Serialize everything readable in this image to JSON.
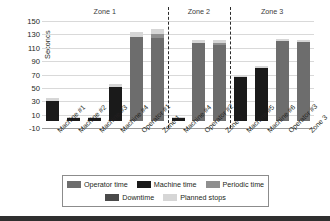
{
  "chart_data": {
    "type": "bar",
    "title": "",
    "xlabel": "",
    "ylabel": "Seconds",
    "ylim": [
      -10,
      150
    ],
    "yticks": [
      -10,
      10,
      30,
      50,
      70,
      90,
      110,
      130,
      150
    ],
    "grid": true,
    "stacked": true,
    "legend_position": "bottom",
    "legend": [
      "Operator time",
      "Machine time",
      "Periodic time",
      "Downtime",
      "Planned stops"
    ],
    "group_labels": [
      "Zone 1",
      "Zone 2",
      "Zone 3"
    ],
    "groups": [
      {
        "name": "Zone 1",
        "categories": [
          "Machine #1",
          "Machine #2",
          "Machine #3",
          "Machine #4",
          "Operator #1",
          "Zone 1"
        ]
      },
      {
        "name": "Zone 2",
        "categories": [
          "Machine #4",
          "Operator #2",
          "Zone 2"
        ]
      },
      {
        "name": "Zone 3",
        "categories": [
          "Machine #5",
          "Machine #6",
          "Operator #3",
          "Zone 3"
        ]
      }
    ],
    "categories": [
      "Machine #1",
      "Machine #2",
      "Machine #3",
      "Machine #4",
      "Operator #1",
      "Zone 1",
      "Machine #4",
      "Operator #2",
      "Zone 2",
      "Machine #5",
      "Machine #6",
      "Operator #3",
      "Zone 3"
    ],
    "series": [
      {
        "name": "Operator time",
        "color": "#6d6d6d",
        "values": [
          0,
          0,
          0,
          0,
          126,
          125,
          0,
          117,
          114,
          0,
          0,
          120,
          119
        ]
      },
      {
        "name": "Machine time",
        "color": "#1a1a1a",
        "values": [
          30,
          5,
          5,
          52,
          0,
          0,
          5,
          0,
          0,
          66,
          79,
          0,
          0
        ]
      },
      {
        "name": "Periodic time",
        "color": "#8f8f8f",
        "values": [
          0,
          0,
          0,
          0,
          0,
          5,
          0,
          0,
          3,
          0,
          0,
          0,
          0
        ]
      },
      {
        "name": "Downtime",
        "color": "#4a4a4a",
        "values": [
          0,
          0,
          0,
          0,
          0,
          0,
          0,
          0,
          0,
          0,
          0,
          0,
          0
        ]
      },
      {
        "name": "Planned stops",
        "color": "#d6d6d6",
        "values": [
          5,
          2,
          2,
          4,
          7,
          8,
          2,
          4,
          5,
          3,
          3,
          3,
          3
        ]
      }
    ],
    "totals": [
      35,
      7,
      7,
      56,
      133,
      138,
      7,
      121,
      122,
      69,
      82,
      123,
      122
    ]
  },
  "axis": {
    "ylabel": "Seconds"
  },
  "legend_items": [
    {
      "label": "Operator time",
      "color": "#6d6d6d"
    },
    {
      "label": "Machine time",
      "color": "#1a1a1a"
    },
    {
      "label": "Periodic time",
      "color": "#8f8f8f"
    },
    {
      "label": "Downtime",
      "color": "#4a4a4a"
    },
    {
      "label": "Planned stops",
      "color": "#d6d6d6"
    }
  ]
}
